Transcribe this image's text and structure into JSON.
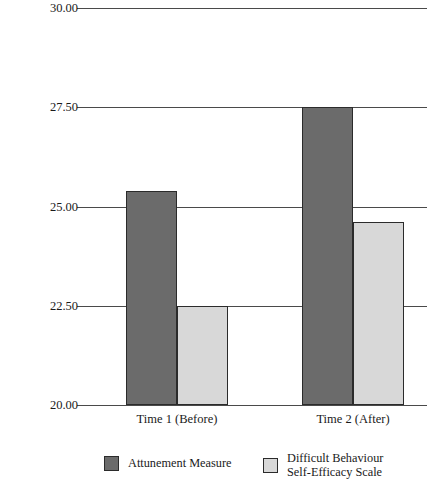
{
  "chart_data": {
    "type": "bar",
    "title": "",
    "xlabel": "",
    "ylabel": "Average Score",
    "ylim": [
      20.0,
      30.0
    ],
    "yticks": [
      "20.00",
      "22.50",
      "25.00",
      "27.50",
      "30.00"
    ],
    "ytick_values": [
      20.0,
      22.5,
      25.0,
      27.5,
      30.0
    ],
    "grid": "horizontal",
    "legend_position": "bottom",
    "categories": [
      "Time 1 (Before)",
      "Time 2 (After)"
    ],
    "series": [
      {
        "name": "Attunement Measure",
        "color": "#6b6b6b",
        "values": [
          25.4,
          27.5
        ]
      },
      {
        "name": "Difficult Behaviour Self-Efficacy Scale",
        "name_line1": "Difficult Behaviour",
        "name_line2": "Self-Efficacy Scale",
        "color": "#d8d8d8",
        "values": [
          22.5,
          24.6
        ]
      }
    ]
  },
  "axis": {
    "y_title": "Average Score",
    "ticks": [
      {
        "label": "30.00",
        "value": 30.0
      },
      {
        "label": "27.50",
        "value": 27.5
      },
      {
        "label": "25.00",
        "value": 25.0
      },
      {
        "label": "22.50",
        "value": 22.5
      },
      {
        "label": "20.00",
        "value": 20.0
      }
    ],
    "categories": [
      {
        "label": "Time 1 (Before)"
      },
      {
        "label": "Time 2 (After)"
      }
    ]
  },
  "legend": {
    "items": [
      {
        "label": "Attunement Measure",
        "line1": "Attunement Measure",
        "line2": "",
        "color": "#6b6b6b"
      },
      {
        "label": "Difficult Behaviour Self-Efficacy Scale",
        "line1": "Difficult Behaviour",
        "line2": "Self-Efficacy Scale",
        "color": "#d8d8d8"
      }
    ]
  },
  "colors": {
    "series_dark": "#6b6b6b",
    "series_light": "#d8d8d8",
    "gridline": "#4a4a4a",
    "bar_outline": "#2b2b2b",
    "text": "#1a1a1a",
    "background": "#ffffff"
  }
}
